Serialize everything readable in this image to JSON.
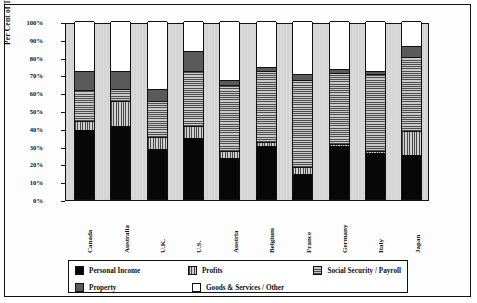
{
  "chart_data": {
    "type": "bar",
    "variant": "stacked-percent",
    "title": "",
    "xlabel": "Country",
    "ylabel": "Per Cent of Tax Revenue",
    "ylim": [
      0,
      100
    ],
    "grid": false,
    "legend_position": "bottom",
    "ytick_labels": [
      "100%",
      "90%",
      "80%",
      "70%",
      "60%",
      "50%",
      "40%",
      "30%",
      "20%",
      "10%",
      "0%"
    ],
    "ytick_values": [
      100,
      90,
      80,
      70,
      60,
      50,
      40,
      30,
      20,
      10,
      0
    ],
    "categories": [
      "Canada",
      "Australia",
      "U.K.",
      "U.S.",
      "Austria",
      "Belgium",
      "France",
      "Germany",
      "Italy",
      "Japan"
    ],
    "series": [
      {
        "name": "Personal Income",
        "color": "#070707",
        "pattern": "solid-black",
        "values": [
          39,
          41,
          28,
          34,
          23,
          30,
          14,
          30,
          26,
          25
        ]
      },
      {
        "name": "Profits",
        "color": "#4a4a4a",
        "pattern": "vertical-stripes",
        "values": [
          5,
          14,
          7,
          7,
          4,
          2,
          4,
          1,
          1,
          13
        ]
      },
      {
        "name": "Social Security / Payroll",
        "color": "#4d4d4d",
        "pattern": "horizontal-stripes",
        "values": [
          17,
          7,
          20,
          31,
          37,
          40,
          49,
          40,
          43,
          42
        ]
      },
      {
        "name": "Property",
        "color": "#5a5a5a",
        "pattern": "solid-dark-gray",
        "values": [
          11,
          10,
          7,
          11,
          3,
          2,
          3,
          2,
          2,
          6
        ]
      },
      {
        "name": "Goods & Services / Other",
        "color": "#ffffff",
        "pattern": "white",
        "values": [
          28,
          28,
          38,
          17,
          33,
          26,
          30,
          27,
          28,
          14
        ]
      }
    ]
  },
  "legend": {
    "items": [
      {
        "label": "Personal Income"
      },
      {
        "label": "Profits"
      },
      {
        "label": "Social Security / Payroll"
      },
      {
        "label": "Property"
      },
      {
        "label": "Goods & Services / Other"
      }
    ]
  }
}
